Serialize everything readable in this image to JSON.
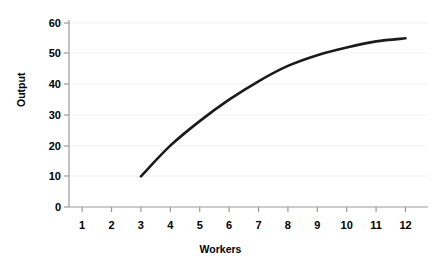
{
  "chart_data": {
    "type": "line",
    "title": "",
    "xlabel": "Workers",
    "ylabel": "Output",
    "xlim": [
      0.5,
      12.5
    ],
    "ylim": [
      0,
      60
    ],
    "grid": true,
    "legend": "none",
    "x_ticks": [
      "1",
      "2",
      "3",
      "4",
      "5",
      "6",
      "7",
      "8",
      "9",
      "10",
      "11",
      "12"
    ],
    "y_ticks": [
      "0",
      "10",
      "20",
      "30",
      "40",
      "50",
      "60"
    ],
    "series": [
      {
        "name": "Total product",
        "color": "#1a1a1a",
        "x": [
          3,
          4,
          5,
          6,
          7,
          8,
          9,
          10,
          11,
          12
        ],
        "values": [
          10,
          20,
          28,
          35,
          41,
          46,
          49.5,
          52,
          54,
          55
        ]
      }
    ]
  },
  "axis": {
    "x_title": "Workers",
    "y_title": "Output"
  },
  "ticks": {
    "x": [
      "1",
      "2",
      "3",
      "4",
      "5",
      "6",
      "7",
      "8",
      "9",
      "10",
      "11",
      "12"
    ],
    "y": [
      "60",
      "50",
      "40",
      "30",
      "20",
      "10",
      "0"
    ]
  },
  "colors": {
    "curve": "#1a1a1a",
    "grid": "#f0f0f0",
    "axis": "#9a9a9a",
    "text": "#000000",
    "background": "#ffffff"
  }
}
